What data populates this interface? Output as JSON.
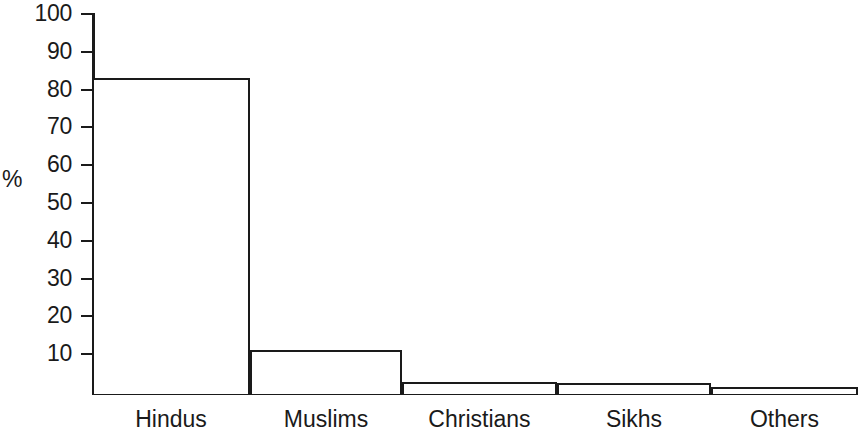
{
  "chart_data": {
    "type": "bar",
    "title": "",
    "subtitle": "",
    "xlabel": "",
    "ylabel": "%",
    "categories": [
      "Hindus",
      "Muslims",
      "Christians",
      "Sikhs",
      "Others"
    ],
    "values": [
      83,
      11,
      2.6,
      2.5,
      1.3
    ],
    "series": [
      {
        "name": "Share of population",
        "values": [
          83,
          11,
          2.6,
          2.5,
          1.3
        ]
      }
    ],
    "ylim": [
      0,
      100
    ],
    "ytick_labels": [
      "100",
      "90",
      "80",
      "70",
      "60",
      "50",
      "40",
      "30",
      "20",
      "10"
    ],
    "ytick_values": [
      100,
      90,
      80,
      70,
      60,
      50,
      40,
      30,
      20,
      10
    ],
    "grid": false,
    "legend": false,
    "legend_position": "none",
    "bar_fill_color": "#ffffff",
    "bar_outline_color": "#1a1a1a",
    "axis_color": "#1a1a1a",
    "background_color": "#ffffff",
    "annotations": []
  },
  "axes": {
    "y_title": "%",
    "ticks": [
      {
        "label": "100",
        "value": 100
      },
      {
        "label": "90",
        "value": 90
      },
      {
        "label": "80",
        "value": 80
      },
      {
        "label": "70",
        "value": 70
      },
      {
        "label": "60",
        "value": 60
      },
      {
        "label": "50",
        "value": 50
      },
      {
        "label": "40",
        "value": 40
      },
      {
        "label": "30",
        "value": 30
      },
      {
        "label": "20",
        "value": 20
      },
      {
        "label": "10",
        "value": 10
      }
    ]
  },
  "categories": [
    {
      "label": "Hindus",
      "value": 83
    },
    {
      "label": "Muslims",
      "value": 11
    },
    {
      "label": "Christians",
      "value": 2.6
    },
    {
      "label": "Sikhs",
      "value": 2.5
    },
    {
      "label": "Others",
      "value": 1.3
    }
  ]
}
